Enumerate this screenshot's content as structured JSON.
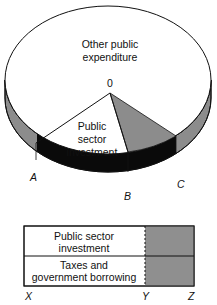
{
  "diagram": {
    "pie": {
      "regions": [
        {
          "id": "other",
          "label_lines": [
            "Other public",
            "expenditure"
          ],
          "fill": "#ffffff"
        },
        {
          "id": "investment",
          "label_lines": [
            "Public",
            "sector",
            "investment"
          ],
          "fill": "#ffffff"
        },
        {
          "id": "shaded",
          "label_lines": [],
          "fill": "#8c8c8c"
        }
      ],
      "apex_label": "0",
      "rim_colors": {
        "grey": "#8c8c8c",
        "black": "#0a0a0a"
      },
      "points": {
        "A": "A",
        "B": "B",
        "C": "C"
      }
    },
    "bar": {
      "rows": [
        {
          "label_lines": [
            "Public sector",
            "investment"
          ]
        },
        {
          "label_lines": [
            "Taxes and",
            "government borrowing"
          ]
        }
      ],
      "shaded_fill": "#8f8f8f",
      "axis_labels": {
        "X": "X",
        "Y": "Y",
        "Z": "Z"
      }
    }
  }
}
